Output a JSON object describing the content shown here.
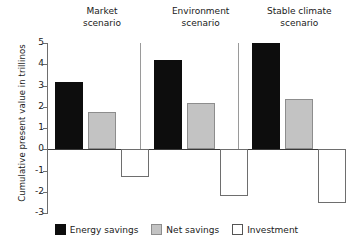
{
  "chart_data": {
    "type": "bar",
    "title": "",
    "xlabel": "",
    "ylabel": "Cumulative present value in trillinos",
    "ylim": [
      -3,
      5
    ],
    "yticks": [
      5,
      4,
      3,
      2,
      1,
      0,
      -1,
      -2,
      -3
    ],
    "ytick_labels": [
      "5",
      "4",
      "3",
      "2",
      "1",
      "0",
      "-1",
      "-2",
      "-3"
    ],
    "grid": false,
    "legend_position": "bottom",
    "categories": [
      "Market\nscenario",
      "Environment\nscenario",
      "Stable climate\nscenario"
    ],
    "series": [
      {
        "name": "Energy savings",
        "color": "#0d0d0d",
        "values": [
          3.15,
          4.2,
          5.0
        ]
      },
      {
        "name": "Net savings",
        "color": "#c3c3c3",
        "values": [
          1.75,
          2.2,
          2.35
        ]
      },
      {
        "name": "Investment",
        "color": "#ffffff",
        "values": [
          -1.3,
          -2.2,
          -2.55
        ]
      }
    ]
  },
  "groups": [
    {
      "label": "Market\nscenario"
    },
    {
      "label": "Environment\nscenario"
    },
    {
      "label": "Stable climate\nscenario"
    }
  ],
  "legend": {
    "items": [
      {
        "label": "Energy savings",
        "swatch": "black-square-swatch"
      },
      {
        "label": "Net savings",
        "swatch": "gray-square-swatch"
      },
      {
        "label": "Investment",
        "swatch": "white-square-swatch"
      }
    ]
  },
  "axis": {
    "y_title": "Cumulative present value in trillinos",
    "y_ticks": [
      "5",
      "4",
      "3",
      "2",
      "1",
      "0",
      "-1",
      "-2",
      "-3"
    ]
  }
}
